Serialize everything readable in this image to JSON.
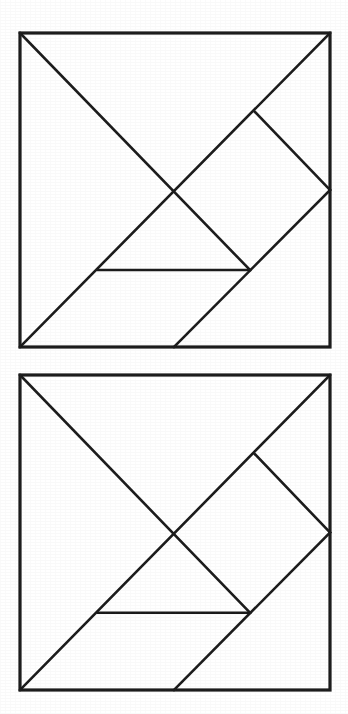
{
  "page": {
    "background_color": "#ffffff",
    "width": 348,
    "height": 714,
    "caption": "",
    "figure_count": 2
  },
  "style": {
    "line_color": "#1a1a1a",
    "fill_color": "#ffffff",
    "outline_width": 3.2,
    "cut_width": 2.6
  },
  "figures": [
    {
      "id": "figure-1",
      "label": "",
      "name": "tangram-square-top",
      "square": {
        "x": 20,
        "y": 33,
        "width": 310,
        "height": 314
      },
      "piece_count": 7
    },
    {
      "id": "figure-2",
      "label": "",
      "name": "tangram-square-bottom",
      "square": {
        "x": 20,
        "y": 375,
        "width": 310,
        "height": 315
      },
      "piece_count": 7
    }
  ],
  "chart_data": {
    "type": "diagram",
    "subtitle": "",
    "xlabel": "",
    "ylabel": "",
    "coordinate_space": {
      "width": 310,
      "height": 314,
      "origin": "top-left of square"
    },
    "vertices": {
      "top_left": [
        0,
        0
      ],
      "top_right": [
        310,
        0
      ],
      "bottom_right": [
        310,
        314
      ],
      "bottom_left": [
        0,
        314
      ],
      "center": [
        152,
        157
      ],
      "diamond_top": [
        235,
        79
      ],
      "diamond_right": [
        310,
        157
      ],
      "diamond_bottom": [
        230,
        237
      ],
      "horizontal_left": [
        78,
        237
      ],
      "bottom_diagonal_foot": [
        154,
        314
      ]
    },
    "cut_lines": [
      {
        "name": "anti-diagonal-main",
        "from": [
          310,
          0
        ],
        "to": [
          0,
          314
        ]
      },
      {
        "name": "diagonal-top-left-to-center",
        "from": [
          0,
          0
        ],
        "to": [
          230,
          237
        ]
      },
      {
        "name": "diamond-upper-right-edge",
        "from": [
          235,
          79
        ],
        "to": [
          310,
          157
        ]
      },
      {
        "name": "diamond-lower-right-edge",
        "from": [
          310,
          157
        ],
        "to": [
          154,
          314
        ]
      },
      {
        "name": "horizontal-cut",
        "from": [
          78,
          237
        ],
        "to": [
          230,
          237
        ]
      }
    ],
    "pieces": [
      {
        "name": "large-triangle-upper-left",
        "shape": "right triangle",
        "vertices": [
          [
            0,
            0
          ],
          [
            310,
            0
          ],
          [
            152,
            157
          ]
        ]
      },
      {
        "name": "large-triangle-lower-left",
        "shape": "right triangle",
        "vertices": [
          [
            0,
            0
          ],
          [
            152,
            157
          ],
          [
            0,
            314
          ]
        ]
      },
      {
        "name": "medium-triangle-right",
        "shape": "right triangle",
        "vertices": [
          [
            235,
            79
          ],
          [
            310,
            157
          ],
          [
            230,
            237
          ]
        ]
      },
      {
        "name": "small-triangle-upper",
        "shape": "right triangle",
        "vertices": [
          [
            152,
            157
          ],
          [
            235,
            79
          ],
          [
            230,
            237
          ]
        ]
      },
      {
        "name": "small-triangle-lower",
        "shape": "right triangle",
        "vertices": [
          [
            78,
            237
          ],
          [
            230,
            237
          ],
          [
            154,
            314
          ]
        ]
      },
      {
        "name": "square-piece",
        "shape": "square",
        "vertices": [
          [
            152,
            157
          ],
          [
            235,
            79
          ],
          [
            310,
            157
          ],
          [
            230,
            237
          ]
        ]
      },
      {
        "name": "parallelogram-piece",
        "shape": "parallelogram",
        "vertices": [
          [
            0,
            314
          ],
          [
            78,
            237
          ],
          [
            230,
            237
          ],
          [
            154,
            314
          ]
        ]
      }
    ],
    "grid": false,
    "legend": "none"
  }
}
